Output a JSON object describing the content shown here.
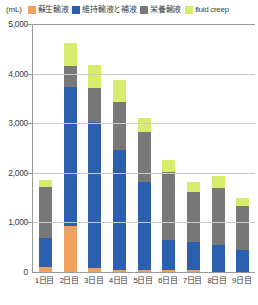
{
  "chart_data": {
    "type": "bar",
    "stacked": true,
    "title": "",
    "xlabel": "",
    "ylabel": "",
    "unit_label": "(mL)",
    "ylim": [
      0,
      5000
    ],
    "ytick_values": [
      0,
      1000,
      2000,
      3000,
      4000,
      5000
    ],
    "ytick_labels": [
      "0",
      "1,000",
      "2,000",
      "3,000",
      "4,000",
      "5,000"
    ],
    "grid": true,
    "legend_position": "top",
    "categories": [
      "1日目",
      "2日目",
      "3日目",
      "4日目",
      "5日目",
      "6日目",
      "7日目",
      "8日目",
      "9日目"
    ],
    "series": [
      {
        "name": "蘇生輸液",
        "color": "#f0a15c",
        "values": [
          100,
          930,
          80,
          40,
          40,
          40,
          40,
          0,
          0
        ]
      },
      {
        "name": "維持輸液と補液",
        "color": "#2c5fad",
        "values": [
          580,
          2800,
          2940,
          2420,
          1770,
          600,
          560,
          540,
          440
        ]
      },
      {
        "name": "栄養輸液",
        "color": "#787878",
        "values": [
          1040,
          420,
          690,
          970,
          1010,
          1370,
          1010,
          1150,
          890
        ]
      },
      {
        "name": "fluid creep",
        "color": "#d8ec6b",
        "values": [
          140,
          470,
          460,
          440,
          280,
          240,
          200,
          240,
          160
        ]
      }
    ],
    "totals": [
      1860,
      4620,
      4170,
      3870,
      3100,
      2250,
      1810,
      1930,
      1490
    ]
  },
  "colors": {
    "axis": "#9a9a9a",
    "gridline": "#c9c9c9",
    "text": "#3d3d3d",
    "background": "#ffffff"
  }
}
